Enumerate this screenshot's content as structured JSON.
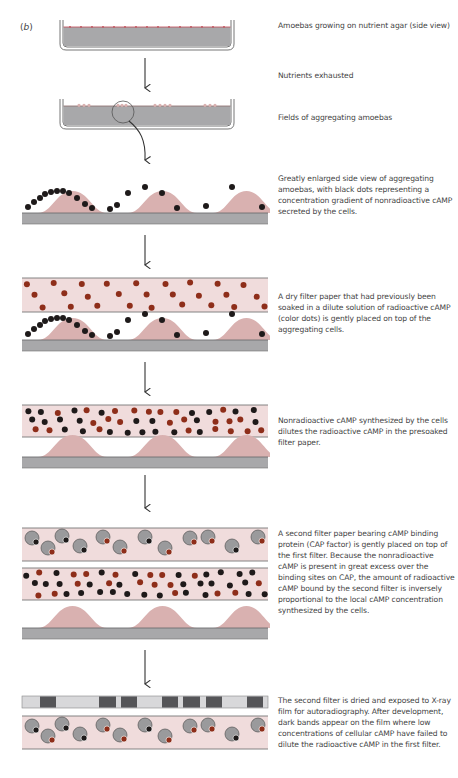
{
  "figure": {
    "panel_label_open": "(",
    "panel_label_letter": "b",
    "panel_label_close": ")",
    "colors": {
      "agar": "#a8a8aa",
      "agar_edge": "#6e6e70",
      "cell_pink": "#d9b1b0",
      "filter_pink": "#f0dcdc",
      "filter_edge": "#777777",
      "black_camp": "#1e1a1a",
      "radio_camp": "#8e2e1a",
      "cap_protein": "#9a9a9c",
      "film_light": "#d8d8da",
      "film_dark": "#555558"
    },
    "steps": [
      {
        "id": "agar-growth",
        "caption": "Amoebas growing on nutrient agar (side view)"
      },
      {
        "id": "nutrients",
        "caption": "Nutrients exhausted"
      },
      {
        "id": "aggregating",
        "caption": "Fields of aggregating amoebas"
      },
      {
        "id": "enlarged",
        "caption": "Greatly enlarged side view of aggregating amoebas, with black dots representing a concentration gradient of nonradioactive cAMP secreted by the cells."
      },
      {
        "id": "dry-filter",
        "caption": "A dry filter paper that had previously been soaked in a dilute solution of radioactive cAMP (color dots) is gently placed on top of the aggregating cells."
      },
      {
        "id": "dilution",
        "caption": "Nonradioactive cAMP synthesized by the cells dilutes the radioactive cAMP in the presoaked filter paper."
      },
      {
        "id": "second-filter",
        "caption": "A second filter paper bearing cAMP binding protein (CAP factor) is gently placed on top of the first filter. Because the nonradioactive cAMP is present in great excess over the binding sites on CAP, the amount of radioactive cAMP bound by the second filter is inversely proportional to the local cAMP concentration synthesized by the cells."
      },
      {
        "id": "autoradiography",
        "caption": "The second filter is dried and exposed to X-ray film for autoradiography. After development, dark bands appear on the film where low concentrations of cellular cAMP have failed to dilute the radioactive cAMP in the first filter."
      }
    ],
    "legend": {
      "black_dots": "nonradioactive cAMP",
      "color_dots": "radioactive cAMP"
    }
  }
}
